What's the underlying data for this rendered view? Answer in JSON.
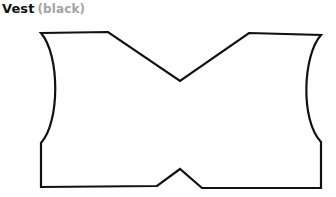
{
  "pattern": {
    "name": "Vest",
    "color_label": "(black)",
    "stroke_color": "#111111",
    "subtitle_color": "#a3a3a3"
  }
}
